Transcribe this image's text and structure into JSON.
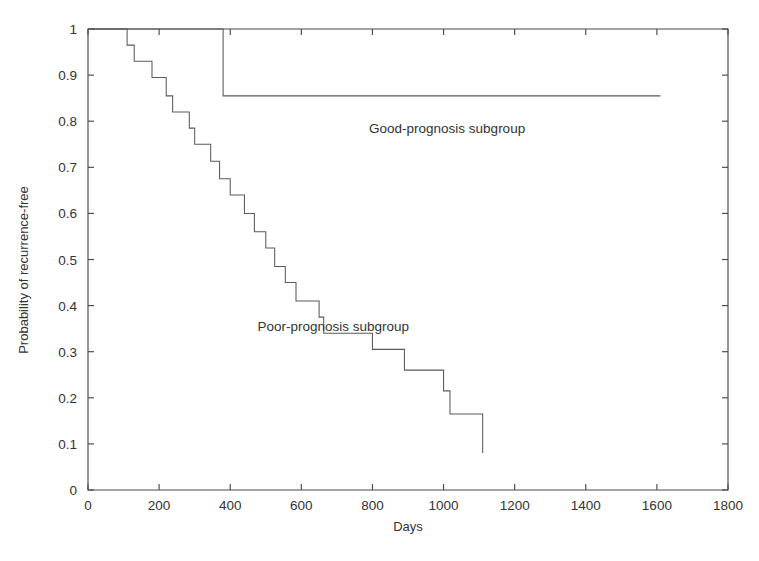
{
  "chart_data": {
    "type": "line",
    "title": "",
    "subtitle": "",
    "xlabel": "Days",
    "ylabel": "Probability of recurrence-free",
    "xlim": [
      0,
      1800
    ],
    "ylim": [
      0,
      1
    ],
    "xticks": [
      0,
      200,
      400,
      600,
      800,
      1000,
      1200,
      1400,
      1600,
      1800
    ],
    "xtick_labels": [
      "0",
      "200",
      "400",
      "600",
      "800",
      "1000",
      "1200",
      "1400",
      "1600",
      "1800"
    ],
    "yticks": [
      0,
      0.1,
      0.2,
      0.3,
      0.4,
      0.5,
      0.6,
      0.7,
      0.8,
      0.9,
      1
    ],
    "ytick_labels": [
      "0",
      "0.1",
      "0.2",
      "0.3",
      "0.4",
      "0.5",
      "0.6",
      "0.7",
      "0.8",
      "0.9",
      "1"
    ],
    "grid": false,
    "legend_position": "inline-annotation",
    "line_color": "#5a5a5a",
    "axis_color": "#4a4a4a",
    "series": [
      {
        "name": "Good-prognosis subgroup",
        "step": "post",
        "annotation": "Good-prognosis subgroup",
        "annotation_x": 1010,
        "annotation_y": 0.775,
        "x": [
          0,
          380,
          380,
          1610
        ],
        "y": [
          1.0,
          1.0,
          0.855,
          0.855
        ]
      },
      {
        "name": "Poor-prognosis subgroup",
        "step": "post",
        "annotation": "Poor-prognosis subgroup",
        "annotation_x": 690,
        "annotation_y": 0.345,
        "x": [
          0,
          110,
          110,
          130,
          130,
          180,
          180,
          220,
          220,
          238,
          238,
          285,
          285,
          300,
          300,
          345,
          345,
          370,
          370,
          400,
          400,
          440,
          440,
          468,
          468,
          500,
          500,
          525,
          525,
          555,
          555,
          585,
          585,
          620,
          620,
          650,
          650,
          663,
          663,
          800,
          800,
          830,
          830,
          890,
          890,
          905,
          905,
          1000,
          1000,
          1018,
          1018,
          1110,
          1110
        ],
        "y": [
          1.0,
          1.0,
          0.965,
          0.965,
          0.93,
          0.93,
          0.895,
          0.895,
          0.855,
          0.855,
          0.82,
          0.82,
          0.785,
          0.785,
          0.75,
          0.75,
          0.713,
          0.713,
          0.675,
          0.675,
          0.64,
          0.64,
          0.6,
          0.6,
          0.56,
          0.56,
          0.525,
          0.525,
          0.485,
          0.485,
          0.45,
          0.45,
          0.41,
          0.41,
          0.41,
          0.41,
          0.375,
          0.375,
          0.34,
          0.34,
          0.305,
          0.305,
          0.305,
          0.305,
          0.26,
          0.26,
          0.26,
          0.26,
          0.215,
          0.215,
          0.165,
          0.165,
          0.08
        ]
      }
    ]
  }
}
